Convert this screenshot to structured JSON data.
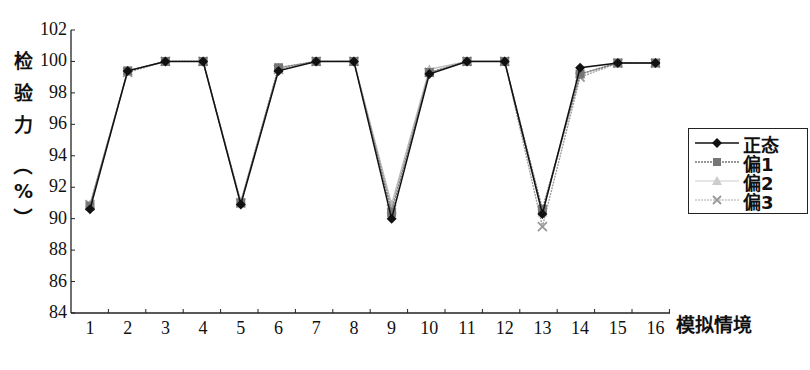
{
  "chart_data": {
    "type": "line",
    "title": "",
    "xlabel": "模拟情境",
    "ylabel": "检验力（%）",
    "ylabel_chars": [
      "检",
      "验",
      "力",
      "（",
      "%",
      "）"
    ],
    "x": [
      1,
      2,
      3,
      4,
      5,
      6,
      7,
      8,
      9,
      10,
      11,
      12,
      13,
      14,
      15,
      16
    ],
    "x_tick_labels": [
      "1",
      "2",
      "3",
      "4",
      "5",
      "6",
      "7",
      "8",
      "9",
      "10",
      "11",
      "12",
      "13",
      "14",
      "15",
      "16"
    ],
    "y_tick_labels": [
      "84",
      "86",
      "88",
      "90",
      "92",
      "94",
      "96",
      "98",
      "100",
      "102"
    ],
    "ylim": [
      84,
      102
    ],
    "grid": false,
    "legend_position": "right",
    "series": [
      {
        "name": "正态",
        "marker": "diamond",
        "color": "#111111",
        "line": "solid",
        "values": [
          90.6,
          99.4,
          100.0,
          100.0,
          90.9,
          99.4,
          100.0,
          100.0,
          90.0,
          99.2,
          100.0,
          100.0,
          90.3,
          99.6,
          99.9,
          99.9
        ]
      },
      {
        "name": "偏1",
        "marker": "square",
        "color": "#777777",
        "line": "dotted",
        "values": [
          90.8,
          99.4,
          100.0,
          100.0,
          91.0,
          99.6,
          100.0,
          100.0,
          90.4,
          99.3,
          100.0,
          100.0,
          90.6,
          99.2,
          99.9,
          99.9
        ]
      },
      {
        "name": "偏2",
        "marker": "triangle",
        "color": "#bbbbbb",
        "line": "solid",
        "values": [
          90.9,
          99.4,
          100.0,
          100.0,
          91.1,
          99.6,
          100.0,
          100.0,
          90.9,
          99.5,
          100.0,
          100.0,
          90.4,
          99.2,
          99.9,
          99.9
        ]
      },
      {
        "name": "偏3",
        "marker": "x",
        "color": "#999999",
        "line": "dotted",
        "values": [
          90.9,
          99.3,
          100.0,
          100.0,
          91.0,
          99.5,
          100.0,
          100.0,
          90.6,
          99.3,
          100.0,
          100.0,
          89.5,
          99.0,
          99.9,
          99.9
        ]
      }
    ]
  }
}
